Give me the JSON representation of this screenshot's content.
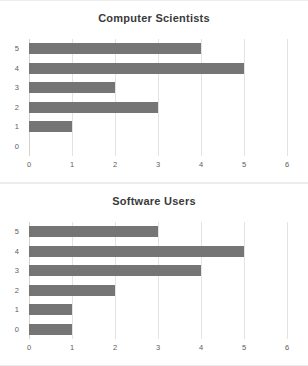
{
  "chart_data": [
    {
      "type": "bar",
      "orientation": "horizontal",
      "title": "Computer Scientists",
      "xlabel": "",
      "ylabel": "",
      "categories": [
        "5",
        "4",
        "3",
        "2",
        "1",
        "0"
      ],
      "values": [
        4,
        5,
        2,
        3,
        1,
        0
      ],
      "xticks": [
        "0",
        "1",
        "2",
        "3",
        "4",
        "5",
        "6"
      ],
      "xlim": [
        0,
        6
      ],
      "grid": "vertical",
      "legend": "none",
      "bar_color": "#757575"
    },
    {
      "type": "bar",
      "orientation": "horizontal",
      "title": "Software Users",
      "xlabel": "",
      "ylabel": "",
      "categories": [
        "5",
        "4",
        "3",
        "2",
        "1",
        "0"
      ],
      "values": [
        3,
        5,
        4,
        2,
        1,
        1
      ],
      "xticks": [
        "0",
        "1",
        "2",
        "3",
        "4",
        "5",
        "6"
      ],
      "xlim": [
        0,
        6
      ],
      "grid": "vertical",
      "legend": "none",
      "bar_color": "#757575"
    }
  ]
}
